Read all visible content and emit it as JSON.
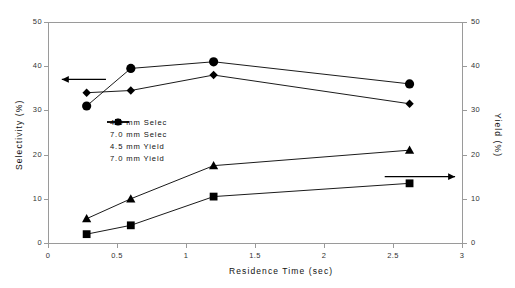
{
  "chart_data": {
    "type": "line",
    "title": "",
    "xlabel": "Residence Time (sec)",
    "ylabel": "Selectivity (%)",
    "y2label": "Yield (%)",
    "xlim": [
      0,
      3
    ],
    "ylim": [
      0,
      50
    ],
    "y2lim": [
      0,
      50
    ],
    "grid": false,
    "legend_position": "center-left-inside",
    "xticks": [
      "0",
      "0.5",
      "1",
      "1.5",
      "2",
      "2.5",
      "3"
    ],
    "xtick_values": [
      0,
      0.5,
      1,
      1.5,
      2,
      2.5,
      3
    ],
    "yticks": [
      "0",
      "10",
      "20",
      "30",
      "40",
      "50"
    ],
    "ytick_values": [
      0,
      10,
      20,
      30,
      40,
      50
    ],
    "y2ticks": [
      "0",
      "10",
      "20",
      "30",
      "40",
      "50"
    ],
    "y2tick_values": [
      0,
      10,
      20,
      30,
      40,
      50
    ],
    "series": [
      {
        "name": "4.5 mm Selec",
        "marker": "circle",
        "axis": "left",
        "color": "#000000",
        "x": [
          0.28,
          0.6,
          1.2,
          2.62
        ],
        "values": [
          31,
          39.5,
          41,
          36
        ]
      },
      {
        "name": "7.0 mm Selec",
        "marker": "diamond",
        "axis": "left",
        "color": "#000000",
        "x": [
          0.28,
          0.6,
          1.2,
          2.62
        ],
        "values": [
          34,
          34.5,
          38,
          31.5
        ]
      },
      {
        "name": "4.5 mm Yield",
        "marker": "triangle",
        "axis": "right",
        "color": "#000000",
        "x": [
          0.28,
          0.6,
          1.2,
          2.62
        ],
        "values": [
          5.5,
          10,
          17.5,
          21
        ]
      },
      {
        "name": "7.0 mm Yield",
        "marker": "square",
        "axis": "right",
        "color": "#000000",
        "x": [
          0.28,
          0.6,
          1.2,
          2.62
        ],
        "values": [
          2,
          4,
          10.5,
          13.5
        ]
      }
    ],
    "annotations": [
      {
        "name": "left-axis-arrow",
        "direction": "left",
        "x_from": 0.42,
        "x_to": 0.1,
        "y": 37
      },
      {
        "name": "right-axis-arrow",
        "direction": "right",
        "x_from": 2.44,
        "x_to": 2.95,
        "y": 15
      }
    ]
  }
}
